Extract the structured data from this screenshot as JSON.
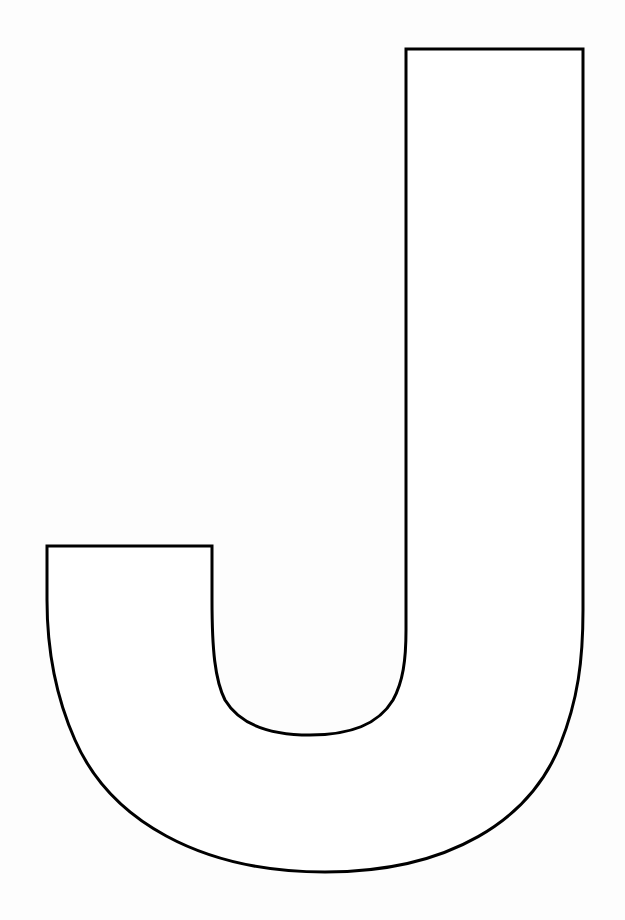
{
  "page": {
    "background": "#fdfdfd"
  },
  "letter": {
    "character": "J",
    "style": "outline",
    "stroke_color": "#000000",
    "fill_color": "#ffffff",
    "stroke_width": 3
  }
}
